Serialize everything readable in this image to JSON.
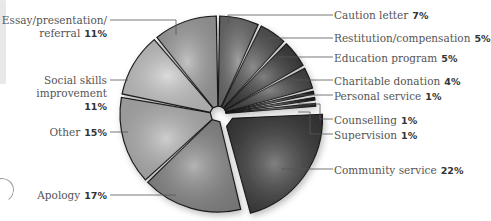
{
  "chart_data": {
    "type": "pie",
    "title": "",
    "start_angle": "12 o'clock, clockwise",
    "exploded": [
      "Community service"
    ],
    "slices": [
      {
        "label": "Caution letter",
        "value": 7,
        "display": "7%",
        "color": "#6e6e6e"
      },
      {
        "label": "Restitution/compensation",
        "value": 5,
        "display": "5%",
        "color": "#4f4f4f"
      },
      {
        "label": "Education program",
        "value": 5,
        "display": "5%",
        "color": "#3a3a3a"
      },
      {
        "label": "Charitable donation",
        "value": 4,
        "display": "4%",
        "color": "#454545"
      },
      {
        "label": "Personal service",
        "value": 1,
        "display": "1%",
        "color": "#2e2e2e"
      },
      {
        "label": "Counselling",
        "value": 1,
        "display": "1%",
        "color": "#222222"
      },
      {
        "label": "Supervision",
        "value": 1,
        "display": "1%",
        "color": "#333333"
      },
      {
        "label": "Community service",
        "value": 22,
        "display": "22%",
        "color": "#3c3c3c"
      },
      {
        "label": "Apology",
        "value": 17,
        "display": "17%",
        "color": "#8a8a8a"
      },
      {
        "label": "Other",
        "value": 15,
        "display": "15%",
        "color": "#b4b4b4"
      },
      {
        "label": "Social skills improvement",
        "value": 11,
        "display": "11%",
        "color": "#c8c8c8"
      },
      {
        "label": "Essay/presentation/referral",
        "value": 11,
        "display": "11%",
        "color": "#a2a2a2"
      }
    ]
  },
  "labels": {
    "caution": {
      "text": "Caution letter",
      "pct": "7%"
    },
    "restitution": {
      "text": "Restitution/compensation",
      "pct": "5%"
    },
    "education": {
      "text": "Education program",
      "pct": "5%"
    },
    "charitable": {
      "text": "Charitable donation",
      "pct": "4%"
    },
    "personal": {
      "text": "Personal service",
      "pct": "1%"
    },
    "counselling": {
      "text": "Counselling",
      "pct": "1%"
    },
    "supervision": {
      "text": "Supervision",
      "pct": "1%"
    },
    "community": {
      "text": "Community service",
      "pct": "22%"
    },
    "apology": {
      "text": "Apology",
      "pct": "17%"
    },
    "other": {
      "text": "Other",
      "pct": "15%"
    },
    "social_line1": {
      "text": "Social skills"
    },
    "social_line2": {
      "text": "improvement"
    },
    "social_pct": {
      "pct": "11%"
    },
    "essay_line1": {
      "text": "Essay/presentation/"
    },
    "essay_line2": {
      "text": "referral",
      "pct": "11%"
    }
  }
}
